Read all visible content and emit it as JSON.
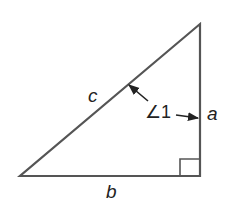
{
  "diagram": {
    "type": "right-triangle",
    "stroke_color": "#555555",
    "text_color": "#222222",
    "vertices": {
      "bottom_left": [
        20,
        176
      ],
      "bottom_right": [
        200,
        176
      ],
      "top_right": [
        200,
        24
      ]
    },
    "labels": {
      "hypotenuse": "c",
      "vertical_side": "a",
      "base": "b",
      "angle": "∠1"
    },
    "right_angle_marker": true,
    "annotations": [
      {
        "label": "∠1",
        "arrows_to": [
          "hypotenuse c",
          "side a"
        ]
      }
    ]
  }
}
